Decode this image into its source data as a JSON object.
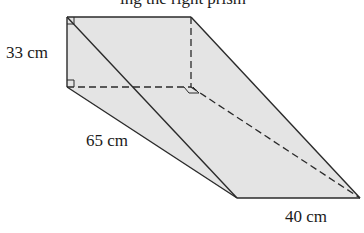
{
  "caption_fragment": "ing the right prism",
  "labels": {
    "height": "33 cm",
    "hypotenuse": "65 cm",
    "length": "40 cm"
  },
  "colors": {
    "fill": "#e4e4e4",
    "stroke": "#2a2a2a",
    "background": "#ffffff"
  },
  "shape": "triangular-prism"
}
